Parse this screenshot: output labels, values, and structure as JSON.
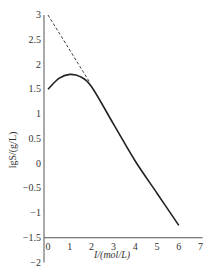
{
  "chart_data": {
    "type": "line",
    "title": "",
    "xlabel": "I/(mol/L)",
    "ylabel": "lgS/(g/L)",
    "xlim": [
      0,
      7
    ],
    "ylim": [
      -2,
      3
    ],
    "x_ticks": [
      "0",
      "1",
      "2",
      "3",
      "4",
      "5",
      "6",
      "7"
    ],
    "y_ticks": [
      "3",
      "2.5",
      "2",
      "1.5",
      "1",
      "0.5",
      "0",
      "-0.5",
      "-1",
      "-1.5",
      "-2"
    ],
    "grid": false,
    "legend": "none",
    "series": [
      {
        "name": "solid curve",
        "style": "solid",
        "x": [
          0,
          0.5,
          1.0,
          1.5,
          2.0,
          3.0,
          4.0,
          5.0,
          6.0
        ],
        "y": [
          1.5,
          1.72,
          1.8,
          1.75,
          1.55,
          0.8,
          0.05,
          -0.6,
          -1.25
        ]
      },
      {
        "name": "dashed extrapolation",
        "style": "dashed",
        "x": [
          0,
          1.9
        ],
        "y": [
          3.0,
          1.65
        ]
      }
    ]
  },
  "labels": {
    "xlabel": "I/(mol/L)",
    "ylabel": "lgS/(g/L)"
  }
}
